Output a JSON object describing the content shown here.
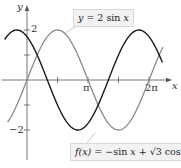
{
  "chart_data": {
    "type": "line",
    "title": "",
    "xlabel": "x",
    "ylabel": "y",
    "xlim": [
      -1.25,
      7.4
    ],
    "ylim": [
      -2.6,
      2.9
    ],
    "grid": false,
    "x_ticks": [
      {
        "value": 1.5708,
        "label": ""
      },
      {
        "value": 3.1416,
        "label": "π"
      },
      {
        "value": 4.7124,
        "label": ""
      },
      {
        "value": 6.2832,
        "label": "2π"
      }
    ],
    "y_ticks": [
      {
        "value": 2,
        "label": "2"
      },
      {
        "value": 1,
        "label": ""
      },
      {
        "value": -1,
        "label": ""
      },
      {
        "value": -2,
        "label": "−2"
      }
    ],
    "series": [
      {
        "name": "y = 2 sin x",
        "formula": "2*sin(x)",
        "domain": [
          -1.0,
          7.0
        ],
        "color": "#8a8a8a",
        "key_points": [
          [
            0,
            0
          ],
          [
            1.5708,
            2
          ],
          [
            3.1416,
            0
          ],
          [
            4.7124,
            -2
          ],
          [
            6.2832,
            0
          ]
        ]
      },
      {
        "name": "f(x) = −sin x + √3 cos x",
        "formula": "-sin(x)+sqrt(3)*cos(x)",
        "domain": [
          -1.15,
          7.0
        ],
        "color": "#1a1a1a",
        "key_points": [
          [
            -0.5236,
            2
          ],
          [
            0,
            1.732
          ],
          [
            1.0472,
            0
          ],
          [
            2.618,
            -2
          ],
          [
            4.1888,
            0
          ],
          [
            5.7596,
            2
          ]
        ]
      }
    ],
    "annotations": [
      {
        "text": "y = 2 sin x",
        "target_series": 0
      },
      {
        "text": "f(x) = −sin x + √3 cos x",
        "target_series": 1
      }
    ]
  },
  "labels": {
    "y_axis": "y",
    "x_axis": "x",
    "tick_2": "2",
    "tick_neg2": "−2",
    "tick_pi": "π",
    "tick_2pi": "2π",
    "top_box": {
      "lhs": "y",
      "rhs": " = 2 sin ",
      "var": "x"
    },
    "bottom_box": {
      "fx": "f(x)",
      "rhs1": " = −sin ",
      "x1": "x",
      "rhs2": " + √3 cos ",
      "x2": "x"
    }
  },
  "layout": {
    "origin_px": [
      27,
      80
    ],
    "px_per_rad": 19.42,
    "px_per_unit": 25
  }
}
